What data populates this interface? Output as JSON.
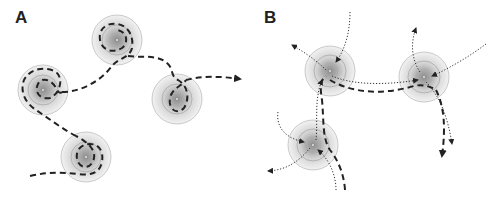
{
  "figure": {
    "panels": [
      {
        "id": "A",
        "label": "A",
        "description": "Single trajectory (dashed) hopping between four confinement zones",
        "zones": [
          {
            "cx": 117,
            "cy": 40
          },
          {
            "cx": 43,
            "cy": 90
          },
          {
            "cx": 177,
            "cy": 99
          },
          {
            "cx": 86,
            "cy": 157
          }
        ],
        "trajectory_style": "dashed",
        "arrow_end": {
          "x": 244,
          "y": 79
        }
      },
      {
        "id": "B",
        "label": "B",
        "description": "Multiple trajectories (dotted and dashed) converging into and exiting three zones",
        "zones": [
          {
            "cx": 330,
            "cy": 71
          },
          {
            "cx": 424,
            "cy": 77
          },
          {
            "cx": 313,
            "cy": 145
          }
        ],
        "trajectory_styles": [
          "dotted",
          "dashed"
        ]
      }
    ],
    "colors": {
      "zone_outer": "#eeeeee",
      "zone_mid": "#d8d8d8",
      "zone_inner": "#b5b5b5",
      "zone_ring": "#9a9a9a",
      "path": "#222222",
      "background": "#ffffff"
    }
  }
}
